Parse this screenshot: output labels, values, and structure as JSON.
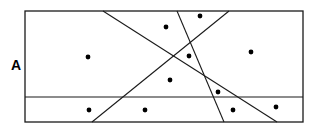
{
  "figure": {
    "title": "",
    "type": "geometric-diagram",
    "width": 315,
    "height": 133,
    "background_color": "#ffffff",
    "stroke_color": "#1a1a1a",
    "dot_color": "#000000"
  },
  "labels": [
    {
      "id": "region-label-a",
      "text": "A",
      "x": 11,
      "y": 58,
      "font_size": 14,
      "bold": true
    }
  ],
  "chart_data": {
    "type": "scatter",
    "title": "",
    "xlabel": "",
    "ylabel": "",
    "xlim": [
      25,
      303
    ],
    "ylim": [
      11,
      122
    ],
    "grid": false,
    "legend": "none",
    "annotations": [
      "A"
    ],
    "boundary": {
      "name": "outer-rectangle",
      "x": 25,
      "y": 11,
      "width": 278,
      "height": 111,
      "stroke_width": 1.3
    },
    "partition_lines": [
      {
        "name": "horizontal-divider",
        "orientation": "horizontal",
        "x1": 25,
        "y1": 97,
        "x2": 303,
        "y2": 97,
        "stroke_width": 1.1
      },
      {
        "name": "diagonal-line-1",
        "orientation": "diagonal",
        "x1": 103,
        "y1": 11,
        "x2": 277,
        "y2": 122,
        "stroke_width": 1.1
      },
      {
        "name": "diagonal-line-2",
        "orientation": "diagonal",
        "x1": 177,
        "y1": 11,
        "x2": 224,
        "y2": 122,
        "stroke_width": 1.1
      },
      {
        "name": "diagonal-line-3",
        "orientation": "diagonal",
        "x1": 229,
        "y1": 11,
        "x2": 92,
        "y2": 122,
        "stroke_width": 1.1
      }
    ],
    "points": [
      {
        "id": "point-1",
        "x": 88,
        "y": 57,
        "r": 2.4
      },
      {
        "id": "point-2",
        "x": 166,
        "y": 27,
        "r": 2.4
      },
      {
        "id": "point-3",
        "x": 200,
        "y": 16,
        "r": 2.4
      },
      {
        "id": "point-4",
        "x": 189,
        "y": 56,
        "r": 2.4
      },
      {
        "id": "point-5",
        "x": 251,
        "y": 52,
        "r": 2.4
      },
      {
        "id": "point-6",
        "x": 170,
        "y": 80,
        "r": 2.4
      },
      {
        "id": "point-7",
        "x": 218,
        "y": 92,
        "r": 2.4
      },
      {
        "id": "point-8",
        "x": 89,
        "y": 110,
        "r": 2.4
      },
      {
        "id": "point-9",
        "x": 145,
        "y": 110,
        "r": 2.4
      },
      {
        "id": "point-10",
        "x": 233,
        "y": 110,
        "r": 2.4
      },
      {
        "id": "point-11",
        "x": 276,
        "y": 107,
        "r": 2.4
      }
    ],
    "counts": {
      "points_total": 11,
      "lines_total": 4
    }
  }
}
